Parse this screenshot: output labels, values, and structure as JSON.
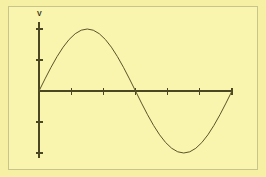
{
  "figure": {
    "background_color": "#f6f0a4",
    "panel_color": "#f9f4ae",
    "frame_color": "#c9c487",
    "axis_color": "#4a4722",
    "curve_color": "#5a5526",
    "yaxis_label": "V"
  },
  "chart_data": {
    "type": "line",
    "title": "",
    "subtitle": "",
    "xlabel": "",
    "ylabel": "V",
    "grid": false,
    "legend": null,
    "annotations": [],
    "xlim": [
      0,
      6.2832
    ],
    "ylim": [
      -1.25,
      1.25
    ],
    "x_tick_values": [
      0,
      1.0472,
      2.0944,
      3.1416,
      4.1888,
      5.236,
      6.2832
    ],
    "x_tick_labels": [
      "",
      "",
      "",
      "",
      "",
      "",
      ""
    ],
    "y_tick_values": [
      -1,
      -0.5,
      0.5,
      1
    ],
    "y_tick_labels": [
      "",
      "",
      "",
      ""
    ],
    "series": [
      {
        "name": "sine",
        "x": [
          0,
          0.1963,
          0.3927,
          0.589,
          0.7854,
          0.9817,
          1.1781,
          1.3744,
          1.5708,
          1.7671,
          1.9635,
          2.1598,
          2.3562,
          2.5525,
          2.7489,
          2.9452,
          3.1416,
          3.3379,
          3.5343,
          3.7306,
          3.927,
          4.1233,
          4.3197,
          4.516,
          4.7124,
          4.9087,
          5.1051,
          5.3014,
          5.4978,
          5.6941,
          5.8905,
          6.0868,
          6.2832
        ],
        "values": [
          0,
          0.1951,
          0.3827,
          0.5556,
          0.7071,
          0.8315,
          0.9239,
          0.9808,
          1.0,
          0.9808,
          0.9239,
          0.8315,
          0.7071,
          0.5556,
          0.3827,
          0.1951,
          0,
          -0.1951,
          -0.3827,
          -0.5556,
          -0.7071,
          -0.8315,
          -0.9239,
          -0.9808,
          -1.0,
          -0.9808,
          -0.9239,
          -0.8315,
          -0.7071,
          -0.5556,
          -0.3827,
          -0.1951,
          0
        ]
      }
    ]
  },
  "geometry": {
    "origin_x": 39,
    "origin_y": 91,
    "x_axis_end": 232,
    "y_axis_top": 22,
    "y_axis_bottom": 158,
    "amplitude_px": 62,
    "period_px": 193
  }
}
